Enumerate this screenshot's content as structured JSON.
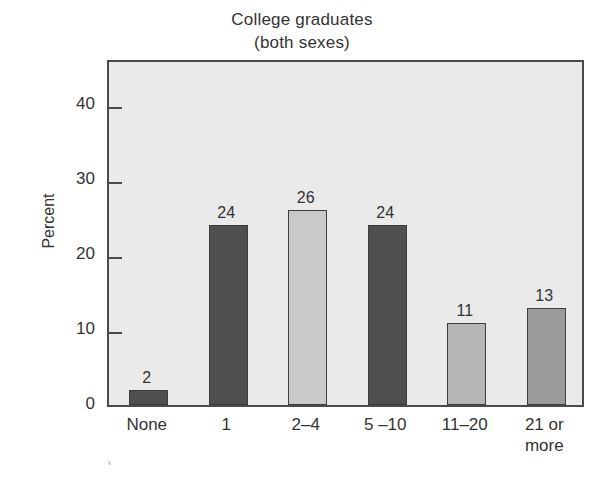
{
  "chart_data": {
    "type": "bar",
    "title": "College graduates",
    "subtitle": "(both sexes)",
    "title_lines": [
      "College graduates",
      "(both sexes)"
    ],
    "xlabel": "",
    "ylabel": "Percent",
    "categories": [
      "None",
      "1",
      "2–4",
      "5 –10",
      "11–20",
      "21 or more"
    ],
    "category_lines": [
      [
        "None"
      ],
      [
        "1"
      ],
      [
        "2–4"
      ],
      [
        "5 –10"
      ],
      [
        "11–20"
      ],
      [
        "21 or",
        "more"
      ]
    ],
    "values": [
      2,
      24,
      26,
      24,
      11,
      13
    ],
    "value_labels": [
      "2",
      "24",
      "26",
      "24",
      "11",
      "13"
    ],
    "bar_colors": [
      "#4f4f4f",
      "#4f4f4f",
      "#c9c9c9",
      "#4f4f4f",
      "#b6b6b6",
      "#9b9b9b"
    ],
    "ylim": [
      0,
      46
    ],
    "yticks": [
      0,
      10,
      20,
      30,
      40
    ],
    "ytick_labels": [
      "0",
      "10",
      "20",
      "30",
      "40"
    ],
    "grid": false,
    "legend": null,
    "plot_background": "#eaeaea",
    "axis_color": "#4a4a4a",
    "text_color": "#333333"
  }
}
